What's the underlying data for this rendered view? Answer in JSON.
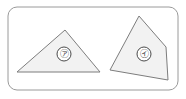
{
  "figure": {
    "frame": {
      "name": "rounded-rectangle-border",
      "x": 8,
      "y": 7,
      "width": 170,
      "height": 83,
      "corner_radius": 9,
      "stroke_color": "#9a9a9a",
      "fill_color": "#ffffff",
      "stroke_width": 1
    },
    "background_color": "#ffffff",
    "shape_fill_color": "#f2f2f2",
    "shape_stroke_color": "#7d7d7d",
    "label_text_color": "#3a3a3a",
    "shapes": [
      {
        "id": "shape-a",
        "name": "triangle-a",
        "kind": "triangle",
        "sides": 3,
        "label": "㋐",
        "label_x": 64,
        "label_y": 54,
        "label_radius": 7,
        "points": "17,72 65,30 100,72"
      },
      {
        "id": "shape-i",
        "name": "quadrilateral-i",
        "kind": "quadrilateral",
        "sides": 4,
        "label": "㋑",
        "label_x": 144,
        "label_y": 54,
        "label_radius": 7,
        "points": "110,70 139,16 166,47 168,80"
      }
    ]
  }
}
